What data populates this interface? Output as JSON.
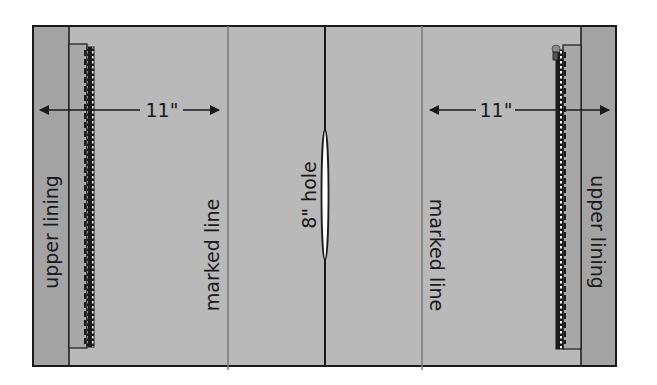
{
  "diagram": {
    "type": "sewing-pattern-layout",
    "colors": {
      "background": "#ffffff",
      "fabric": "#b9b9b9",
      "lining": "#a3a3a3",
      "outline": "#1a1a1a",
      "marked_line": "#7a7a7a",
      "hole_fill": "#ffffff"
    },
    "labels": {
      "left_lining": "upper lining",
      "right_lining": "upper lining",
      "left_marked_line": "marked line",
      "right_marked_line": "marked line",
      "center_hole": "8\" hole",
      "left_measure": "11\"",
      "right_measure": "11\""
    }
  }
}
